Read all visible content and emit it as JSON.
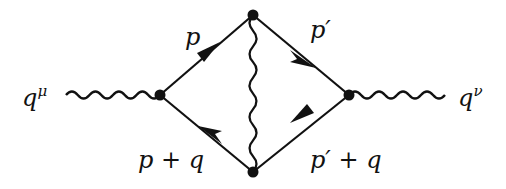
{
  "diagram": {
    "type": "feynman-diagram",
    "labels": {
      "external_left": "q",
      "external_left_index": "μ",
      "external_right": "q",
      "external_right_index": "ν",
      "top_left_momentum": "p",
      "top_right_momentum": "p′",
      "bottom_left_momentum": "p + q",
      "bottom_right_momentum": "p′ + q"
    },
    "vertices": [
      {
        "id": "left",
        "x": 160,
        "y": 95
      },
      {
        "id": "top",
        "x": 253,
        "y": 15
      },
      {
        "id": "bottom",
        "x": 253,
        "y": 172
      },
      {
        "id": "right",
        "x": 349,
        "y": 95
      }
    ],
    "edges": [
      {
        "from": "external-left",
        "to": "left",
        "kind": "photon"
      },
      {
        "from": "left",
        "to": "top",
        "kind": "fermion",
        "label": "p"
      },
      {
        "from": "top",
        "to": "right",
        "kind": "fermion",
        "label": "p′"
      },
      {
        "from": "right",
        "to": "bottom",
        "kind": "fermion",
        "label": "p′ + q"
      },
      {
        "from": "bottom",
        "to": "left",
        "kind": "fermion",
        "label": "p + q"
      },
      {
        "from": "top",
        "to": "bottom",
        "kind": "photon"
      },
      {
        "from": "right",
        "to": "external-right",
        "kind": "photon"
      }
    ],
    "colors": {
      "line": "#111111",
      "background": "#ffffff"
    }
  }
}
